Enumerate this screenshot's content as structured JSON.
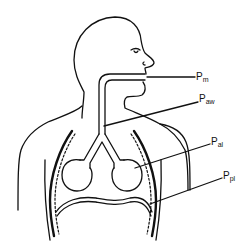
{
  "diagram": {
    "labels": [
      {
        "id": "pm",
        "main": "P",
        "sub": "m",
        "meaning": "mouth pressure"
      },
      {
        "id": "paw",
        "main": "P",
        "sub": "aw",
        "meaning": "airway pressure"
      },
      {
        "id": "pal",
        "main": "P",
        "sub": "al",
        "meaning": "alveolar pressure"
      },
      {
        "id": "ppl",
        "main": "P",
        "sub": "pl",
        "meaning": "pleural pressure"
      }
    ],
    "colors": {
      "stroke": "#111111",
      "background": "#ffffff"
    }
  }
}
